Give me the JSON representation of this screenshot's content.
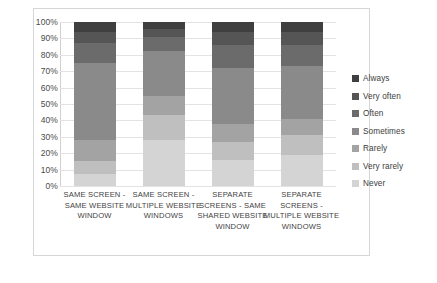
{
  "chart_data": {
    "type": "bar",
    "subtype": "stacked-100-percent",
    "title": "",
    "xlabel": "",
    "ylabel": "",
    "ylim": [
      0,
      100
    ],
    "ytick_labels": [
      "100%",
      "90%",
      "80%",
      "70%",
      "60%",
      "50%",
      "40%",
      "30%",
      "20%",
      "10%",
      "0%"
    ],
    "ytick_values": [
      100,
      90,
      80,
      70,
      60,
      50,
      40,
      30,
      20,
      10,
      0
    ],
    "grid": true,
    "legend_position": "right",
    "categories": [
      "SAME SCREEN - SAME WEBSITE WINDOW",
      "SAME SCREEN - MULTIPLE WEBSITE WINDOWS",
      "SEPARATE SCREENS - SAME SHARED WEBSITE WINDOW",
      "SEPARATE SCREENS - MULTIPLE WEBSITE WINDOWS"
    ],
    "series": [
      {
        "name": "Never",
        "color": "#d4d4d4",
        "values": [
          7,
          28,
          16,
          19
        ]
      },
      {
        "name": "Very rarely",
        "color": "#bfbfbf",
        "values": [
          8,
          15,
          11,
          12
        ]
      },
      {
        "name": "Rarely",
        "color": "#a3a3a3",
        "values": [
          13,
          12,
          11,
          10
        ]
      },
      {
        "name": "Sometimes",
        "color": "#8a8a8a",
        "values": [
          47,
          27,
          34,
          32
        ]
      },
      {
        "name": "Often",
        "color": "#6b6b6b",
        "values": [
          12,
          9,
          14,
          13
        ]
      },
      {
        "name": "Very often",
        "color": "#555555",
        "values": [
          7,
          5,
          8,
          8
        ]
      },
      {
        "name": "Always",
        "color": "#3f3f3f",
        "values": [
          6,
          4,
          6,
          6
        ]
      }
    ]
  },
  "legend": {
    "items": [
      {
        "label": "Always",
        "color": "#3f3f3f"
      },
      {
        "label": "Very often",
        "color": "#555555"
      },
      {
        "label": "Often",
        "color": "#6b6b6b"
      },
      {
        "label": "Sometimes",
        "color": "#8a8a8a"
      },
      {
        "label": "Rarely",
        "color": "#a3a3a3"
      },
      {
        "label": "Very rarely",
        "color": "#bfbfbf"
      },
      {
        "label": "Never",
        "color": "#d4d4d4"
      }
    ]
  }
}
